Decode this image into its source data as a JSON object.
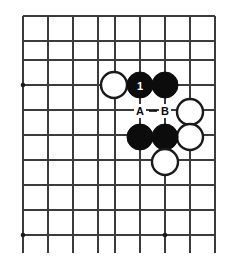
{
  "diagram": {
    "kind": "go-board-diagram",
    "board": {
      "columns": 9,
      "rows": 10,
      "line_color": "#3b3b3b",
      "background_color": "#ffffff",
      "x_positions": [
        23,
        48,
        73,
        98,
        115,
        140,
        165,
        190,
        215
      ],
      "y_positions": [
        16,
        41,
        60,
        85,
        110,
        135,
        160,
        185,
        210,
        235
      ],
      "overhang_bottom": 18,
      "star_points": [
        {
          "name": "star-point-left-upper",
          "x": 23,
          "y": 85
        },
        {
          "name": "star-point-left-lower",
          "x": 23,
          "y": 235
        },
        {
          "name": "star-point-bottom-center",
          "x": 165,
          "y": 235
        }
      ]
    },
    "stones": [
      {
        "id": "white-stone-left",
        "color": "white",
        "x": 114,
        "y": 85,
        "r": 13,
        "label": ""
      },
      {
        "id": "black-stone-move-1",
        "color": "black",
        "x": 140,
        "y": 85,
        "r": 13,
        "label": "1"
      },
      {
        "id": "black-stone-upper-right",
        "color": "black",
        "x": 165,
        "y": 85,
        "r": 13,
        "label": ""
      },
      {
        "id": "white-stone-right-upper",
        "color": "white",
        "x": 190,
        "y": 112,
        "r": 13,
        "label": ""
      },
      {
        "id": "white-stone-right-lower",
        "color": "white",
        "x": 190,
        "y": 137,
        "r": 13,
        "label": ""
      },
      {
        "id": "black-stone-lower-left",
        "color": "black",
        "x": 140,
        "y": 137,
        "r": 13,
        "label": ""
      },
      {
        "id": "black-stone-lower-right",
        "color": "black",
        "x": 165,
        "y": 137,
        "r": 13,
        "label": ""
      },
      {
        "id": "white-stone-bottom",
        "color": "white",
        "x": 165,
        "y": 162,
        "r": 13,
        "label": ""
      }
    ],
    "point_labels": [
      {
        "id": "point-label-a",
        "text": "A",
        "x": 140,
        "y": 111
      },
      {
        "id": "point-label-b",
        "text": "B",
        "x": 165,
        "y": 111
      }
    ],
    "connectors": [
      {
        "id": "dash-between-a-and-b",
        "x1": 149,
        "y1": 111,
        "x2": 157,
        "y2": 111
      }
    ],
    "colors": {
      "black_stone": "#0c0c0c",
      "white_stone": "#ffffff",
      "stone_outline": "#1a1a1a",
      "grid": "#3b3b3b",
      "label_text": "#0c0c0c",
      "label_on_black": "#ffffff"
    }
  }
}
